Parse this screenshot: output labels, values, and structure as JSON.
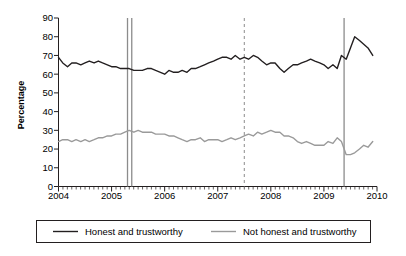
{
  "chart_data": {
    "type": "line",
    "title": "",
    "xlabel": "",
    "ylabel": "Percentage",
    "ylim": [
      0,
      90
    ],
    "ytick_step": 10,
    "yticks": [
      0,
      10,
      20,
      30,
      40,
      50,
      60,
      70,
      80,
      90
    ],
    "xlim": [
      2004,
      2010
    ],
    "xticks": [
      2004,
      2005,
      2006,
      2007,
      2008,
      2009,
      2010
    ],
    "xtick_labels": [
      "2004",
      "2005",
      "2006",
      "2007",
      "2008",
      "2009",
      "2010"
    ],
    "minor_xticks_per_year": 12,
    "grid": false,
    "legend_position": "bottom",
    "colors": {
      "honest": "#231f20",
      "not_honest": "#9a9a9a",
      "vline": "#8c8c8c"
    },
    "annotations": [
      {
        "type": "vline",
        "style": "solid",
        "x": 2005.3,
        "label": ""
      },
      {
        "type": "vline",
        "style": "solid",
        "x": 2005.38,
        "label": ""
      },
      {
        "type": "vline",
        "style": "dashed",
        "x": 2007.5,
        "label": ""
      },
      {
        "type": "vline",
        "style": "solid",
        "x": 2009.38,
        "label": ""
      }
    ],
    "series": [
      {
        "name": "Honest and trustworthy",
        "color": "#231f20",
        "x": [
          2004.0,
          2004.08,
          2004.17,
          2004.25,
          2004.33,
          2004.42,
          2004.5,
          2004.58,
          2004.67,
          2004.75,
          2004.83,
          2004.92,
          2005.0,
          2005.08,
          2005.17,
          2005.25,
          2005.33,
          2005.42,
          2005.5,
          2005.58,
          2005.67,
          2005.75,
          2005.83,
          2005.92,
          2006.0,
          2006.08,
          2006.17,
          2006.25,
          2006.33,
          2006.42,
          2006.5,
          2006.58,
          2006.67,
          2006.75,
          2006.83,
          2006.92,
          2007.0,
          2007.08,
          2007.17,
          2007.25,
          2007.33,
          2007.42,
          2007.5,
          2007.58,
          2007.67,
          2007.75,
          2007.83,
          2007.92,
          2008.0,
          2008.08,
          2008.17,
          2008.25,
          2008.33,
          2008.42,
          2008.5,
          2008.58,
          2008.67,
          2008.75,
          2008.83,
          2008.92,
          2009.0,
          2009.08,
          2009.17,
          2009.25,
          2009.33,
          2009.42,
          2009.5,
          2009.58,
          2009.67,
          2009.75,
          2009.83,
          2009.92
        ],
        "values": [
          69,
          66,
          64,
          66,
          66,
          65,
          66,
          67,
          66,
          67,
          66,
          65,
          64,
          64,
          63,
          63,
          63,
          62,
          62,
          62,
          63,
          63,
          62,
          61,
          60,
          62,
          61,
          61,
          62,
          61,
          63,
          63,
          64,
          65,
          66,
          67,
          68,
          69,
          69,
          68,
          70,
          68,
          69,
          68,
          70,
          69,
          67,
          65,
          66,
          66,
          63,
          61,
          63,
          65,
          65,
          66,
          67,
          68,
          67,
          66,
          65,
          63,
          65,
          63,
          70,
          68,
          74,
          80,
          78,
          76,
          74,
          70
        ]
      },
      {
        "name": "Not honest and trustworthy",
        "color": "#9a9a9a",
        "x": [
          2004.0,
          2004.08,
          2004.17,
          2004.25,
          2004.33,
          2004.42,
          2004.5,
          2004.58,
          2004.67,
          2004.75,
          2004.83,
          2004.92,
          2005.0,
          2005.08,
          2005.17,
          2005.25,
          2005.33,
          2005.42,
          2005.5,
          2005.58,
          2005.67,
          2005.75,
          2005.83,
          2005.92,
          2006.0,
          2006.08,
          2006.17,
          2006.25,
          2006.33,
          2006.42,
          2006.5,
          2006.58,
          2006.67,
          2006.75,
          2006.83,
          2006.92,
          2007.0,
          2007.08,
          2007.17,
          2007.25,
          2007.33,
          2007.42,
          2007.5,
          2007.58,
          2007.67,
          2007.75,
          2007.83,
          2007.92,
          2008.0,
          2008.08,
          2008.17,
          2008.25,
          2008.33,
          2008.42,
          2008.5,
          2008.58,
          2008.67,
          2008.75,
          2008.83,
          2008.92,
          2009.0,
          2009.08,
          2009.17,
          2009.25,
          2009.33,
          2009.42,
          2009.5,
          2009.58,
          2009.67,
          2009.75,
          2009.83,
          2009.92
        ],
        "values": [
          24,
          25,
          25,
          24,
          25,
          24,
          25,
          24,
          25,
          26,
          26,
          27,
          27,
          28,
          28,
          29,
          30,
          29,
          30,
          29,
          29,
          29,
          28,
          28,
          28,
          27,
          27,
          26,
          25,
          24,
          25,
          25,
          26,
          24,
          25,
          25,
          25,
          24,
          25,
          26,
          25,
          26,
          27,
          28,
          27,
          29,
          28,
          29,
          30,
          29,
          29,
          27,
          27,
          26,
          24,
          23,
          24,
          23,
          22,
          22,
          22,
          24,
          23,
          26,
          24,
          17,
          17,
          18,
          20,
          22,
          21,
          24
        ]
      }
    ]
  },
  "legend": {
    "items": [
      {
        "label": "Honest and trustworthy",
        "color": "#231f20"
      },
      {
        "label": "Not honest and trustworthy",
        "color": "#9a9a9a"
      }
    ]
  }
}
